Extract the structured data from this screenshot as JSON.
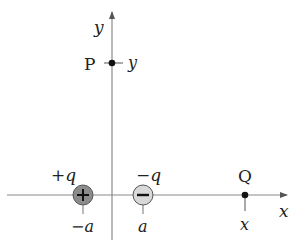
{
  "diagram": {
    "axes": {
      "x_label": "x",
      "y_label": "y",
      "axis_color": "#8a8a8a"
    },
    "points": {
      "P": {
        "name": "P",
        "coord_label": "y"
      },
      "Q": {
        "name": "Q",
        "coord_label": "x"
      }
    },
    "charges": {
      "positive": {
        "label": "+q",
        "position_label": "−a",
        "sign": "+",
        "fill": "#8c8c8c"
      },
      "negative": {
        "label": "−q",
        "position_label": "a",
        "sign": "−",
        "fill": "#d8d8d8"
      }
    }
  }
}
